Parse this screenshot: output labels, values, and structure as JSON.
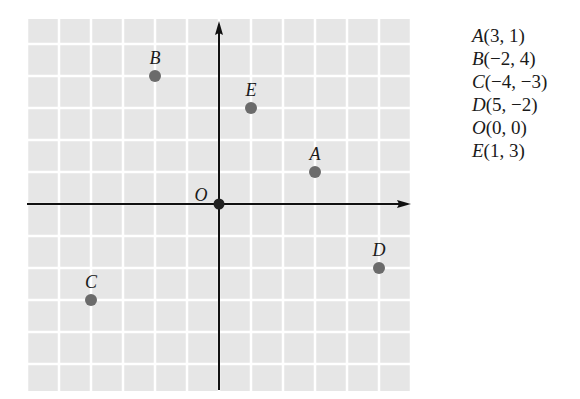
{
  "chart_data": {
    "type": "scatter",
    "title": "",
    "xlabel": "",
    "ylabel": "",
    "xlim": [
      -6,
      6
    ],
    "ylim": [
      -6,
      6
    ],
    "grid": true,
    "grid_step": 1,
    "axes_arrows": true,
    "points": [
      {
        "label": "A",
        "x": 3,
        "y": 1
      },
      {
        "label": "B",
        "x": -2,
        "y": 4
      },
      {
        "label": "C",
        "x": -4,
        "y": -3
      },
      {
        "label": "D",
        "x": 5,
        "y": -2
      },
      {
        "label": "O",
        "x": 0,
        "y": 0
      },
      {
        "label": "E",
        "x": 1,
        "y": 3
      }
    ],
    "legend_position": "right"
  },
  "legend": [
    {
      "name": "A",
      "coords": "(3, 1)"
    },
    {
      "name": "B",
      "coords": "(−2, 4)"
    },
    {
      "name": "C",
      "coords": "(−4, −3)"
    },
    {
      "name": "D",
      "coords": "(5, −2)"
    },
    {
      "name": "O",
      "coords": "(0, 0)"
    },
    {
      "name": "E",
      "coords": "(1, 3)"
    }
  ],
  "colors": {
    "grid_background": "#e6e6e6",
    "grid_lines": "#ffffff",
    "axis": "#111111",
    "point": "#6b6b6b",
    "origin_point": "#222222",
    "text": "#1a1a1a"
  }
}
